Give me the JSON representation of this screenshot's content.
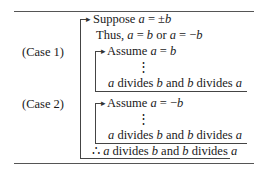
{
  "proof": {
    "suppose": "Suppose a = ±b",
    "thus": "Thus, a = b or a = −b",
    "case1": {
      "label": "(Case 1)",
      "assume": "Assume a = b",
      "dots": "⋮",
      "conclusion": "a divides b and b divides a"
    },
    "case2": {
      "label": "(Case 2)",
      "assume": "Assume a = −b",
      "dots": "⋮",
      "conclusion": "a divides b and b divides a"
    },
    "therefore": "∴ a divides b and b divides a"
  }
}
